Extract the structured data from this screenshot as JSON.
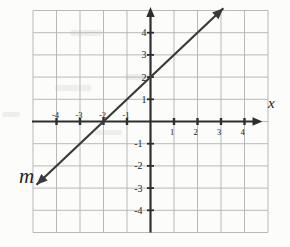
{
  "figure": {
    "background": "#fcfcfa",
    "grid_color": "#b9b9b9",
    "axis_color": "#2e2e2e",
    "line_color": "#3a3a3a",
    "text_color": "#222222"
  },
  "chart_data": {
    "type": "line",
    "title": "",
    "x_axis_label": "x",
    "line_label": "m",
    "equation": "y = x + 2",
    "slope": 1,
    "y_intercept": 2,
    "x_intercept": -2,
    "xlim": [
      -5,
      5
    ],
    "ylim": [
      -5,
      5
    ],
    "x_ticks": [
      -4,
      -3,
      -2,
      -1,
      1,
      2,
      3,
      4
    ],
    "y_ticks": [
      -4,
      -3,
      -2,
      -1,
      1,
      2,
      3,
      4
    ],
    "grid": true,
    "series": [
      {
        "name": "m",
        "points_on_line": [
          [
            -2,
            0
          ],
          [
            0,
            2
          ]
        ],
        "drawn_endpoints": [
          [
            -4.85,
            -2.85
          ],
          [
            3.1,
            5.1
          ]
        ],
        "arrows_both_ends": true
      }
    ]
  }
}
